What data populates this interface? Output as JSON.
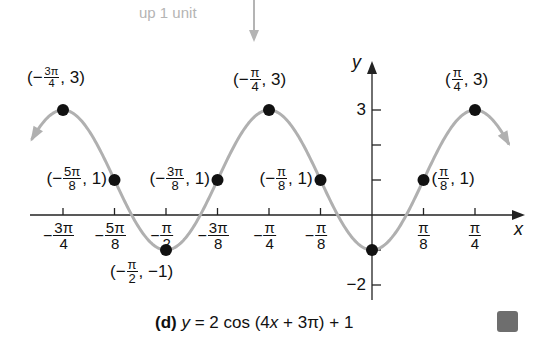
{
  "annotation": {
    "text": "up 1 unit",
    "color": "#b4b4b4"
  },
  "caption": {
    "part": "(d)",
    "equation": "y = 2 cos (4x + 3π) + 1"
  },
  "axes": {
    "x_label": "x",
    "y_label": "y",
    "y_ticks": [
      {
        "value": 3,
        "label": "3"
      },
      {
        "value": 2,
        "label": ""
      },
      {
        "value": 1,
        "label": ""
      },
      {
        "value": -1,
        "label": ""
      },
      {
        "value": -2,
        "label": "−2"
      }
    ],
    "x_ticks": [
      {
        "units": -6,
        "sign": "−",
        "num": "3π",
        "den": "4"
      },
      {
        "units": -5,
        "sign": "−",
        "num": "5π",
        "den": "8"
      },
      {
        "units": -4,
        "sign": "−",
        "num": "π",
        "den": "2"
      },
      {
        "units": -3,
        "sign": "−",
        "num": "3π",
        "den": "8"
      },
      {
        "units": -2,
        "sign": "−",
        "num": "π",
        "den": "4"
      },
      {
        "units": -1,
        "sign": "−",
        "num": "π",
        "den": "8"
      },
      {
        "units": 1,
        "sign": "",
        "num": "π",
        "den": "8"
      },
      {
        "units": 2,
        "sign": "",
        "num": "π",
        "den": "4"
      }
    ]
  },
  "chart_data": {
    "type": "line",
    "title": "(d) y = 2 cos (4x + 3π) + 1",
    "xlabel": "x",
    "ylabel": "y",
    "x_unit": "π/8",
    "xlim_units": [
      -6.6,
      2.65
    ],
    "ylim": [
      -2,
      3
    ],
    "grid": false,
    "legend": null,
    "curve_color": "#b0b0b0",
    "function": "y = 2cos(4x + 3π) + 1",
    "annotation": "up 1 unit",
    "labeled_points": [
      {
        "x": "-3π/4",
        "x_units": -6,
        "y": 3,
        "label": [
          "−",
          "3π",
          "4",
          "3"
        ]
      },
      {
        "x": "-5π/8",
        "x_units": -5,
        "y": 1,
        "label": [
          "−",
          "5π",
          "8",
          "1"
        ]
      },
      {
        "x": "-π/2",
        "x_units": -4,
        "y": -1,
        "label": [
          "−",
          "π",
          "2",
          "−1"
        ]
      },
      {
        "x": "-3π/8",
        "x_units": -3,
        "y": 1,
        "label": [
          "−",
          "3π",
          "8",
          "1"
        ]
      },
      {
        "x": "-π/4",
        "x_units": -2,
        "y": 3,
        "label": [
          "−",
          "π",
          "4",
          "3"
        ]
      },
      {
        "x": "-π/8",
        "x_units": -1,
        "y": 1,
        "label": [
          "−",
          "π",
          "8",
          "1"
        ]
      },
      {
        "x": "0",
        "x_units": 0,
        "y": -1,
        "label": null
      },
      {
        "x": "π/8",
        "x_units": 1,
        "y": 1,
        "label": [
          "",
          "π",
          "8",
          "1"
        ]
      },
      {
        "x": "π/4",
        "x_units": 2,
        "y": 3,
        "label": [
          "",
          "π",
          "4",
          "3"
        ]
      }
    ]
  }
}
